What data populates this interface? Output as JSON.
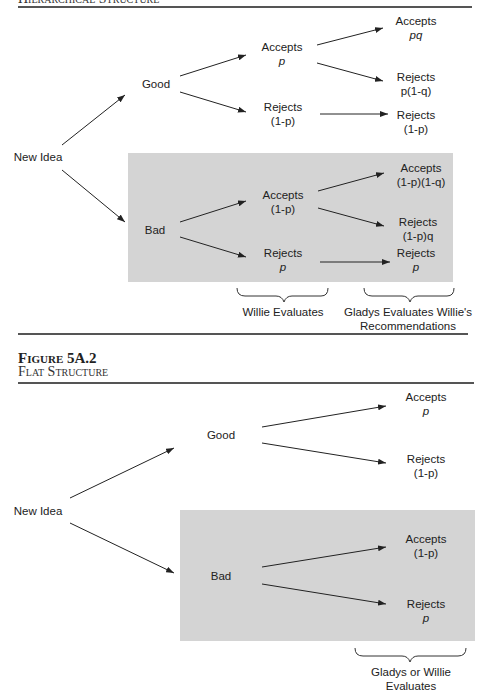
{
  "figure1": {
    "title": "Hierarchical Structure",
    "nodes": {
      "root": "New Idea",
      "good": "Good",
      "bad": "Bad",
      "good_accepts": {
        "label": "Accepts",
        "prob": "p"
      },
      "good_rejects": {
        "label": "Rejects",
        "prob": "(1-p)"
      },
      "good_accepts_accepts": {
        "label": "Accepts",
        "prob": "pq"
      },
      "good_accepts_rejects": {
        "label": "Rejects",
        "prob": "p(1-q)"
      },
      "good_rejects_rejects": {
        "label": "Rejects",
        "prob": "(1-p)"
      },
      "bad_accepts": {
        "label": "Accepts",
        "prob": "(1-p)"
      },
      "bad_rejects": {
        "label": "Rejects",
        "prob": "p"
      },
      "bad_accepts_accepts": {
        "label": "Accepts",
        "prob": "(1-p)(1-q)"
      },
      "bad_accepts_rejects": {
        "label": "Rejects",
        "prob": "(1-p)q"
      },
      "bad_rejects_rejects": {
        "label": "Rejects",
        "prob": "p"
      }
    },
    "braces": {
      "willie": "Willie Evaluates",
      "gladys_line1": "Gladys Evaluates Willie's",
      "gladys_line2": "Recommendations"
    }
  },
  "figure2": {
    "number": "Figure 5A.2",
    "title": "Flat Structure",
    "nodes": {
      "root": "New Idea",
      "good": "Good",
      "bad": "Bad",
      "good_accepts": {
        "label": "Accepts",
        "prob": "p"
      },
      "good_rejects": {
        "label": "Rejects",
        "prob": "(1-p)"
      },
      "bad_accepts": {
        "label": "Accepts",
        "prob": "(1-p)"
      },
      "bad_rejects": {
        "label": "Rejects",
        "prob": "p"
      }
    },
    "braces": {
      "evaluator_line1": "Gladys or Willie",
      "evaluator_line2": "Evaluates"
    }
  },
  "colors": {
    "shade": "#d4d4d4",
    "rule": "#555555",
    "text": "#222222"
  }
}
